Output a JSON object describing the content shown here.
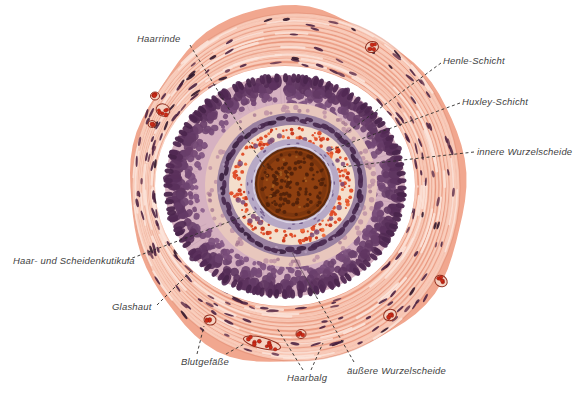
{
  "figure": {
    "labels": {
      "haarrinde": {
        "text": "Haarrinde"
      },
      "henle_schicht": {
        "text": "Henle-Schicht"
      },
      "huxley_schicht": {
        "text": "Huxley-Schicht"
      },
      "innere_wurzelscheide": {
        "text": "innere Wurzelscheide"
      },
      "haar_und_scheidenkutikula": {
        "text": "Haar- und Scheidenkutikula"
      },
      "glashaut": {
        "text": "Glashaut"
      },
      "blutgefaesse": {
        "text": "Blutgefäße"
      },
      "haarbalg": {
        "text": "Haarbalg"
      },
      "aeussere_wurzelscheide": {
        "text": "äußere Wurzelscheide"
      }
    }
  },
  "colors": {
    "background": "#ffffff",
    "label_text": "#3f3f3f",
    "leader_line": "#2f2b2a",
    "fibrous_base": "#f1a78f",
    "fibrous_light": "#f9d2c1",
    "fibrous_lighter": "#fce4da",
    "fibrous_dark": "#e08a70",
    "fibrous_nucleus": "#4a2040",
    "fibrous_nucleus_dark": "#2c1228",
    "fibrous_nucleus_red": "#6b3a52",
    "vessel_wall": "#8d2a1a",
    "vessel_lumen": "#f6d3c3",
    "blood_cell": "#cb2b18",
    "glassy_membrane": "#ffffff",
    "ors_background": "#d6b1c1",
    "ors_striation": "#b08a9e",
    "ors_nucleus_inner": "#8c5f8d",
    "ors_nucleus_outer": "#532a55",
    "pale_band": "#e8c7bd",
    "pale_band_nucleus": "#bc8fa4",
    "henle_base": "#9a81a1",
    "henle_nucleus": "#49284e",
    "henle_nucleus_dark": "#3b1f40",
    "huxley_background": "#f4decc",
    "trichohyalin_granule": "#df4a26",
    "granule_dark": "#c83418",
    "granule_light": "#ef6a3a",
    "huxley_nucleus": "#7b4b77",
    "cuticle_base": "#b7a9c6",
    "cuticle_fleck": "#6a5284",
    "cortex_fill": "#8e3f10",
    "cortex_edge": "#5f2a0b",
    "cortex_dot": "#52220a",
    "cortex_fleck_light": "#aa6323",
    "tissue_crack": "#4d3a48"
  }
}
